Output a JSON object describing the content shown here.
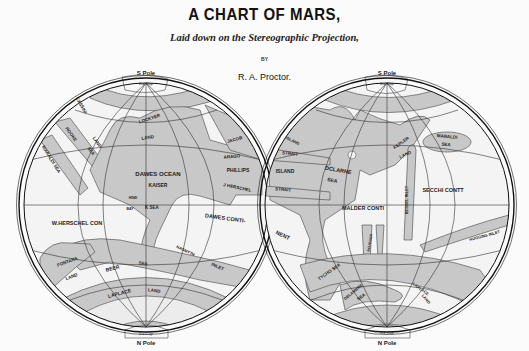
{
  "header": {
    "title": "A CHART OF MARS,",
    "subtitle": "Laid down on the Stereographic Projection,",
    "by": "BY",
    "author": "R. A. Proctor."
  },
  "colors": {
    "background": "#fbfbfb",
    "sea": "#c8c8c8",
    "land": "#f4f4f4",
    "ink": "#1a1a1a"
  },
  "hemispheres": [
    {
      "id": "west",
      "top_pole": "S Pole",
      "bottom_pole": "N Pole",
      "top_cap": "Ice Cap",
      "bottom_cap": "Ice Cap",
      "labels": [
        {
          "text": "CASSINI",
          "x": 80,
          "y": 106,
          "r": 60,
          "s": 4.5
        },
        {
          "text": "LAND",
          "x": 96,
          "y": 143,
          "r": 55,
          "s": 4.5
        },
        {
          "text": "HOOKE",
          "x": 70,
          "y": 135,
          "r": 55,
          "s": 4.5
        },
        {
          "text": "SEA",
          "x": 90,
          "y": 152,
          "r": 55,
          "s": 4.5
        },
        {
          "text": "MARALDI SEA",
          "x": 50,
          "y": 160,
          "r": 58,
          "s": 4.5
        },
        {
          "text": "LOCKYER",
          "x": 150,
          "y": 120,
          "r": -18,
          "s": 4.5
        },
        {
          "text": "LAND",
          "x": 148,
          "y": 139,
          "r": -10,
          "s": 4.5
        },
        {
          "text": "JACOB",
          "x": 235,
          "y": 141,
          "r": -15,
          "s": 4.5
        },
        {
          "text": "ARAGO",
          "x": 232,
          "y": 158,
          "r": -5,
          "s": 4.5
        },
        {
          "text": "DAWES OCEAN",
          "x": 158,
          "y": 176,
          "r": 0,
          "s": 6
        },
        {
          "text": "PHILLIPS",
          "x": 238,
          "y": 172,
          "r": 0,
          "s": 5
        },
        {
          "text": "KAISER",
          "x": 158,
          "y": 187,
          "r": 0,
          "s": 5
        },
        {
          "text": "J HERSCHEL",
          "x": 237,
          "y": 189,
          "r": 12,
          "s": 4.5
        },
        {
          "text": "HIND",
          "x": 133,
          "y": 199,
          "r": 0,
          "s": 3.5
        },
        {
          "text": "BAY",
          "x": 130,
          "y": 210,
          "r": 0,
          "s": 3.5
        },
        {
          "text": "K SEA",
          "x": 152,
          "y": 209,
          "r": 0,
          "s": 4.5
        },
        {
          "text": "W.HERSCHEL CON",
          "x": 77,
          "y": 225,
          "r": 0,
          "s": 5.5
        },
        {
          "text": "DAWES CONTI-",
          "x": 225,
          "y": 220,
          "r": 8,
          "s": 5.5
        },
        {
          "text": "NASMYTH",
          "x": 185,
          "y": 252,
          "r": 25,
          "s": 4
        },
        {
          "text": "INLET",
          "x": 217,
          "y": 268,
          "r": 25,
          "s": 4.5
        },
        {
          "text": "FONTANA",
          "x": 68,
          "y": 263,
          "r": -20,
          "s": 4.5
        },
        {
          "text": "LAND",
          "x": 72,
          "y": 278,
          "r": -20,
          "s": 4.5
        },
        {
          "text": "BEER",
          "x": 113,
          "y": 270,
          "r": -15,
          "s": 5
        },
        {
          "text": "SEA",
          "x": 143,
          "y": 265,
          "r": 8,
          "s": 4.5
        },
        {
          "text": "LAPLACE",
          "x": 120,
          "y": 295,
          "r": -15,
          "s": 5
        },
        {
          "text": "LAND",
          "x": 154,
          "y": 292,
          "r": 8,
          "s": 4.5
        }
      ]
    },
    {
      "id": "east",
      "top_pole": "S Pole",
      "bottom_pole": "N Pole",
      "top_cap": "Ice Cap",
      "bottom_cap": "Ice Cap",
      "labels": [
        {
          "text": "ISLAND",
          "x": 292,
          "y": 142,
          "r": 25,
          "s": 4
        },
        {
          "text": "STRAIT",
          "x": 290,
          "y": 155,
          "r": 5,
          "s": 4.5
        },
        {
          "text": "ISLAND",
          "x": 285,
          "y": 173,
          "r": 0,
          "s": 5
        },
        {
          "text": "DCLARNE",
          "x": 338,
          "y": 172,
          "r": 10,
          "s": 5.5
        },
        {
          "text": "SEA",
          "x": 332,
          "y": 182,
          "r": 10,
          "s": 5
        },
        {
          "text": "STRAIT",
          "x": 283,
          "y": 191,
          "r": 5,
          "s": 4.5
        },
        {
          "text": "KEPLER",
          "x": 402,
          "y": 144,
          "r": -35,
          "s": 4.5
        },
        {
          "text": "LAND",
          "x": 406,
          "y": 156,
          "r": -25,
          "s": 4.5
        },
        {
          "text": "MARALDI",
          "x": 447,
          "y": 138,
          "r": 5,
          "s": 4.5
        },
        {
          "text": "SEA",
          "x": 446,
          "y": 146,
          "r": 5,
          "s": 4.5
        },
        {
          "text": "SECCHI CONTT",
          "x": 443,
          "y": 192,
          "r": 0,
          "s": 5.5
        },
        {
          "text": "BESSEL INLET",
          "x": 408,
          "y": 200,
          "r": -90,
          "s": 4
        },
        {
          "text": "MALDER CONTI",
          "x": 363,
          "y": 210,
          "r": 0,
          "s": 5.5
        },
        {
          "text": "NENT",
          "x": 282,
          "y": 237,
          "r": 25,
          "s": 5.5
        },
        {
          "text": "BOUGUER",
          "x": 371,
          "y": 243,
          "r": -80,
          "s": 3.5
        },
        {
          "text": "HUGGINS INLET",
          "x": 485,
          "y": 237,
          "r": -15,
          "s": 4
        },
        {
          "text": "TYCHO SEA",
          "x": 330,
          "y": 273,
          "r": -35,
          "s": 4.5
        },
        {
          "text": "DELAMBRE",
          "x": 354,
          "y": 293,
          "r": -40,
          "s": 4
        },
        {
          "text": "SEA",
          "x": 362,
          "y": 298,
          "r": -35,
          "s": 4.5
        },
        {
          "text": "LAPLACE",
          "x": 420,
          "y": 290,
          "r": 35,
          "s": 4
        },
        {
          "text": "LAND",
          "x": 425,
          "y": 300,
          "r": 50,
          "s": 4
        }
      ]
    }
  ]
}
